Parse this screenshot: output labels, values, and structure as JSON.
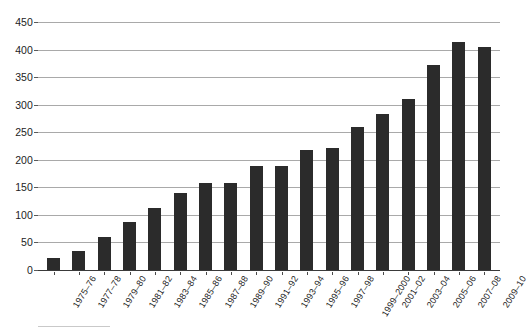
{
  "chart_data": {
    "type": "bar",
    "title": "",
    "xlabel": "",
    "ylabel": "",
    "ylim": [
      0,
      450
    ],
    "ytick_step": 50,
    "grid": true,
    "legend": "none",
    "bar_color": "#2b2b2b",
    "gridline_color": "#a9a9a9",
    "background_color": "#ffffff",
    "yticks": [
      "450",
      "400",
      "350",
      "300",
      "250",
      "200",
      "150",
      "100",
      "50",
      "0"
    ],
    "categories": [
      "1975–76",
      "1977–78",
      "1979–80",
      "1981–82",
      "1983–84",
      "1985–86",
      "1987–88",
      "1989–90",
      "1991–92",
      "1993–94",
      "1995–96",
      "1997–98",
      "1999–2000",
      "2001–02",
      "2003–04",
      "2005–06",
      "2007–08",
      "2009–10"
    ],
    "values": [
      22,
      34,
      60,
      87,
      113,
      140,
      158,
      158,
      188,
      188,
      218,
      222,
      259,
      284,
      311,
      372,
      413,
      405
    ]
  }
}
